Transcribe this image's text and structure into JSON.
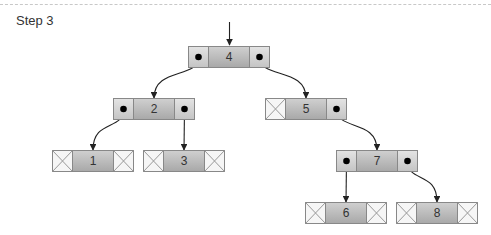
{
  "title": "Step 3",
  "colors": {
    "cell_border": "#888888",
    "side_fill": "#d8d8d8",
    "center_fill": "#bbbbbb",
    "arrow": "#222222"
  },
  "nodes": [
    {
      "id": "4",
      "label": "4",
      "x": 188,
      "y": 46,
      "left": "pointer",
      "right": "pointer"
    },
    {
      "id": "2",
      "label": "2",
      "x": 113,
      "y": 98,
      "left": "pointer",
      "right": "pointer"
    },
    {
      "id": "5",
      "label": "5",
      "x": 265,
      "y": 98,
      "left": "null",
      "right": "pointer"
    },
    {
      "id": "1",
      "label": "1",
      "x": 52,
      "y": 150,
      "left": "null",
      "right": "null"
    },
    {
      "id": "3",
      "label": "3",
      "x": 143,
      "y": 150,
      "left": "null",
      "right": "null"
    },
    {
      "id": "7",
      "label": "7",
      "x": 336,
      "y": 150,
      "left": "pointer",
      "right": "pointer"
    },
    {
      "id": "6",
      "label": "6",
      "x": 305,
      "y": 202,
      "left": "null",
      "right": "null"
    },
    {
      "id": "8",
      "label": "8",
      "x": 396,
      "y": 202,
      "left": "null",
      "right": "null"
    }
  ],
  "edges": [
    {
      "from": "4",
      "side": "left",
      "to": "2"
    },
    {
      "from": "4",
      "side": "right",
      "to": "5"
    },
    {
      "from": "2",
      "side": "left",
      "to": "1"
    },
    {
      "from": "2",
      "side": "right",
      "to": "3"
    },
    {
      "from": "5",
      "side": "right",
      "to": "7"
    },
    {
      "from": "7",
      "side": "left",
      "to": "6"
    },
    {
      "from": "7",
      "side": "right",
      "to": "8"
    }
  ],
  "root_arrow": {
    "x": 229,
    "y1": 22,
    "y2": 45
  }
}
